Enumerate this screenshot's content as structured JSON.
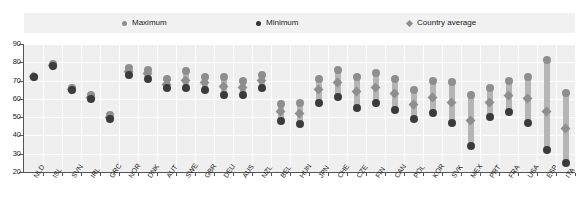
{
  "legend": {
    "items": [
      {
        "label": "Maximum",
        "marker": "circle-gray-icon",
        "color": "#8c8c8c"
      },
      {
        "label": "Minimum",
        "marker": "circle-dark-icon",
        "color": "#333333"
      },
      {
        "label": "Country average",
        "marker": "diamond-gray-icon",
        "color": "#8c8c8c"
      }
    ]
  },
  "chart_data": {
    "type": "scatter",
    "title": "",
    "xlabel": "",
    "ylabel": "",
    "ylim": [
      20,
      90
    ],
    "yticks": [
      20,
      30,
      40,
      50,
      60,
      70,
      80,
      90
    ],
    "grid": true,
    "legend_position": "top",
    "categories": [
      "NLD",
      "ISL",
      "SVN",
      "IRL",
      "GRC",
      "NOR",
      "DNK",
      "AUT",
      "SWE",
      "GBR",
      "DEU",
      "AUS",
      "NZL",
      "BEL",
      "HUN",
      "JPN",
      "CHE",
      "CZE",
      "FIN",
      "CAN",
      "POL",
      "KOR",
      "SVK",
      "MEX",
      "PRT",
      "FRA",
      "USA",
      "ESP",
      "ITA"
    ],
    "series": [
      {
        "name": "Maximum",
        "color": "#8e8e8e",
        "values": [
          72,
          79,
          66,
          62,
          51,
          77,
          76,
          71,
          75,
          72,
          72,
          70,
          73,
          57,
          58,
          71,
          76,
          72,
          74,
          71,
          65,
          70,
          69,
          62,
          66,
          70,
          72,
          81,
          63
        ]
      },
      {
        "name": "Minimum",
        "color": "#3b3b3b",
        "values": [
          72,
          78,
          65,
          60,
          49,
          73,
          71,
          66,
          66,
          65,
          62,
          62,
          66,
          48,
          46,
          58,
          61,
          55,
          58,
          54,
          49,
          52,
          47,
          34,
          50,
          53,
          47,
          32,
          25
        ]
      },
      {
        "name": "Country average",
        "color": "#8e8e8e",
        "values": [
          72,
          78,
          65,
          61,
          50,
          75,
          74,
          68,
          70,
          69,
          67,
          66,
          70,
          53,
          52,
          65,
          69,
          64,
          66,
          63,
          57,
          61,
          58,
          48,
          58,
          62,
          60,
          53,
          44
        ]
      }
    ]
  }
}
